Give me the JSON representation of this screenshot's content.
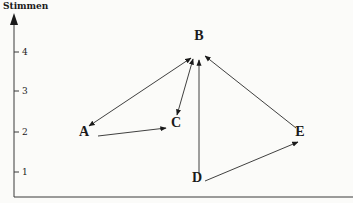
{
  "diagram": {
    "y_axis": {
      "title": "Stimmen",
      "ticks": [
        {
          "value": 1,
          "label": "1"
        },
        {
          "value": 2,
          "label": "2"
        },
        {
          "value": 3,
          "label": "3"
        },
        {
          "value": 4,
          "label": "4"
        }
      ]
    },
    "nodes": [
      {
        "id": "A",
        "label": "A",
        "votes": 2
      },
      {
        "id": "B",
        "label": "B",
        "votes": 4
      },
      {
        "id": "C",
        "label": "C",
        "votes": 2
      },
      {
        "id": "D",
        "label": "D",
        "votes": 1
      },
      {
        "id": "E",
        "label": "E",
        "votes": 2
      }
    ],
    "edges": [
      {
        "from": "A",
        "to": "B",
        "bidirectional": true
      },
      {
        "from": "A",
        "to": "C",
        "bidirectional": false
      },
      {
        "from": "C",
        "to": "B",
        "bidirectional": true
      },
      {
        "from": "D",
        "to": "B",
        "bidirectional": false
      },
      {
        "from": "D",
        "to": "E",
        "bidirectional": false
      },
      {
        "from": "E",
        "to": "B",
        "bidirectional": false
      }
    ]
  }
}
